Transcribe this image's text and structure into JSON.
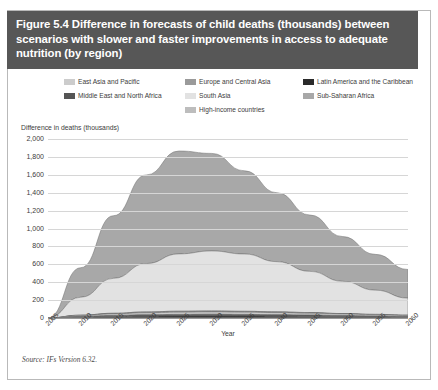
{
  "figure": {
    "title": "Figure 5.4 Difference in forecasts of child deaths (thousands) between scenarios with slower and faster improvements in access to adequate nutrition (by region)",
    "source": "Source: IFs Version 6.32.",
    "header_color": "#575757",
    "border_color": "#b9b9b9"
  },
  "legend": {
    "rows": [
      [
        {
          "label": "East Asia and Pacific",
          "color": "#cccccc"
        },
        {
          "label": "Europe and Central Asia",
          "color": "#9a9a9a"
        },
        {
          "label": "Latin America and the Caribbean",
          "color": "#2b2b2b"
        }
      ],
      [
        {
          "label": "Middle East and North Africa",
          "color": "#555555"
        },
        {
          "label": "South Asia",
          "color": "#e2e2e2"
        },
        {
          "label": "Sub-Saharan Africa",
          "color": "#a8a8a8"
        }
      ],
      [
        {
          "label": "High-income countries",
          "color": "#bdbdbd"
        }
      ]
    ]
  },
  "chart_data": {
    "type": "area",
    "stacked": true,
    "title": "Difference in forecasts of child deaths (thousands) between scenarios with slower and faster improvements in access to adequate nutrition (by region)",
    "xlabel": "Year",
    "ylabel": "Difference in deaths (thousands)",
    "ylim": [
      0,
      2000
    ],
    "ytick_step": 200,
    "grid": true,
    "legend_position": "top",
    "x": [
      2005,
      2010,
      2015,
      2020,
      2025,
      2030,
      2035,
      2040,
      2045,
      2050,
      2055,
      2060
    ],
    "ytick_labels": [
      "2,000",
      "1,800",
      "1,600",
      "1,400",
      "1,200",
      "1,000",
      "800",
      "600",
      "400",
      "200",
      "0"
    ],
    "xtick_labels": [
      "2005",
      "2010",
      "2015",
      "2020",
      "2025",
      "2030",
      "2035",
      "2040",
      "2045",
      "2050",
      "2055",
      "2060"
    ],
    "series": [
      {
        "name": "Latin America and the Caribbean",
        "color": "#2b2b2b",
        "values": [
          0,
          9,
          15,
          19,
          21,
          22,
          21,
          19,
          17,
          14,
          11,
          8
        ]
      },
      {
        "name": "Middle East and North Africa",
        "color": "#555555",
        "values": [
          0,
          8,
          13,
          17,
          19,
          20,
          19,
          18,
          16,
          13,
          11,
          8
        ]
      },
      {
        "name": "East Asia and Pacific",
        "color": "#cccccc",
        "values": [
          0,
          10,
          17,
          22,
          25,
          26,
          25,
          23,
          20,
          17,
          14,
          11
        ]
      },
      {
        "name": "High-income countries",
        "color": "#bdbdbd",
        "values": [
          0,
          2,
          3,
          4,
          4,
          4,
          4,
          3,
          3,
          2,
          2,
          2
        ]
      },
      {
        "name": "Europe and Central Asia",
        "color": "#9a9a9a",
        "values": [
          0,
          3,
          5,
          6,
          7,
          7,
          6,
          6,
          5,
          4,
          3,
          3
        ]
      },
      {
        "name": "South Asia",
        "color": "#e2e2e2",
        "values": [
          0,
          200,
          390,
          540,
          640,
          670,
          640,
          560,
          460,
          360,
          270,
          190
        ]
      },
      {
        "name": "Sub-Saharan Africa",
        "color": "#a8a8a8",
        "values": [
          0,
          330,
          700,
          990,
          1150,
          1090,
          930,
          770,
          630,
          500,
          400,
          320
        ]
      }
    ],
    "totals": [
      0,
      562,
      1143,
      1598,
      1866,
      1839,
      1645,
      1399,
      1151,
      910,
      711,
      542
    ],
    "peak": {
      "x": 2025,
      "y": 1866
    }
  }
}
